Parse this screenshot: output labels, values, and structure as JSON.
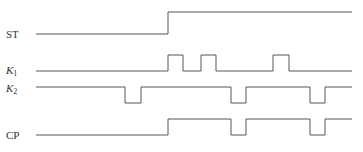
{
  "diagram": {
    "type": "timing-diagram",
    "line_color": "#555555",
    "background": "#ffffff",
    "x_start": 36,
    "x_end": 352,
    "signals": [
      {
        "name": "ST",
        "label_main": "ST",
        "label_sub": "",
        "italic": false,
        "label_y": 38,
        "high_y": 12,
        "low_y": 34,
        "initial": "low",
        "transitions_x": [
          168
        ]
      },
      {
        "name": "K1",
        "label_main": "K",
        "label_sub": "1",
        "italic": true,
        "label_y": 74,
        "high_y": 55,
        "low_y": 71,
        "initial": "low",
        "transitions_x": [
          168,
          183,
          201,
          216,
          273,
          289
        ]
      },
      {
        "name": "K2",
        "label_main": "K",
        "label_sub": "2",
        "italic": true,
        "label_y": 92,
        "high_y": 87,
        "low_y": 103,
        "initial": "high",
        "transitions_x": [
          125,
          141,
          231,
          246,
          310,
          325
        ]
      },
      {
        "name": "CP",
        "label_main": "CP",
        "label_sub": "",
        "italic": false,
        "label_y": 139,
        "high_y": 119,
        "low_y": 135,
        "initial": "low",
        "transitions_x": [
          168,
          231,
          246,
          310,
          325
        ]
      }
    ]
  }
}
